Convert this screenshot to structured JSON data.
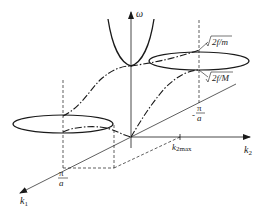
{
  "figure": {
    "axes": {
      "omega": {
        "label": "ω"
      },
      "k1": {
        "label": "k",
        "subscript": "1"
      },
      "k2": {
        "label": "k",
        "subscript": "2"
      }
    },
    "labels": {
      "pi_over_a_num": "π",
      "pi_over_a_den": "a",
      "neg_pi_over_a_sign": "-",
      "neg_pi_over_a_num": "π",
      "neg_pi_over_a_den": "a",
      "k2max_main": "k",
      "k2max_sub": "2max",
      "optical_limit": "2f/m",
      "acoustic_limit": "2f/M"
    },
    "colors": {
      "stroke": "#1a1a1a",
      "background": "#ffffff"
    }
  }
}
